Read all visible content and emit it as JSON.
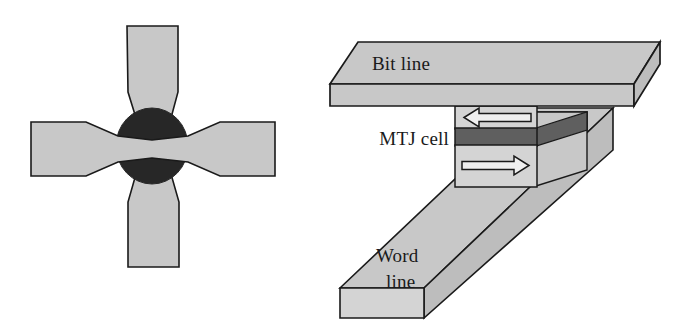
{
  "figure": {
    "background_color": "#ffffff",
    "panels": [
      {
        "id": "left-panel",
        "name": "cross-shaped-mtj-top-view",
        "description": "Top view of a cross shaped magnetic element with a dark elliptical junction region at the centre"
      },
      {
        "id": "right-panel",
        "name": "mtj-cell-3d-view",
        "description": "Three dimensional view of an MTJ cell sandwiched between a bit line above and a word line below"
      }
    ]
  },
  "colors": {
    "light_gray": "#c8c8c8",
    "pale_gray": "#d4d4d4",
    "mid_gray": "#bdbdbd",
    "dark_gray": "#6e6e6e",
    "barrier_gray": "#5f5f5f",
    "near_black": "#272727",
    "outline": "#1a1a1a",
    "white": "#ffffff"
  },
  "left_panel": {
    "name": "cross-element",
    "center_dot_label": "junction-region",
    "arms": [
      {
        "name": "top-arm",
        "orientation": "vertical-up"
      },
      {
        "name": "bottom-arm",
        "orientation": "vertical-down"
      },
      {
        "name": "left-arm",
        "orientation": "horizontal-left"
      },
      {
        "name": "right-arm",
        "orientation": "horizontal-right"
      }
    ]
  },
  "right_panel": {
    "bit_line": {
      "label": "Bit line",
      "name": "bit-line-slab"
    },
    "mtj_cell": {
      "label": "MTJ cell",
      "name": "mtj-cell-stack",
      "layers": [
        {
          "name": "free-layer",
          "arrow": "arrow-left",
          "direction": "left"
        },
        {
          "name": "tunnel-barrier",
          "arrow": null,
          "direction": null
        },
        {
          "name": "pinned-layer",
          "arrow": "arrow-right",
          "direction": "right"
        }
      ]
    },
    "word_line": {
      "label_line1": "Word",
      "label_line2": "line",
      "name": "word-line-slab"
    }
  }
}
